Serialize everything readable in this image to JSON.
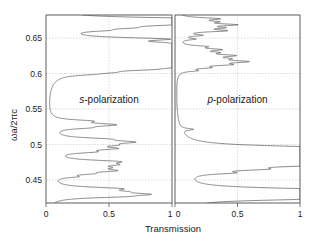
{
  "figure": {
    "title": "",
    "yaxis_label": "ωa/2πc",
    "xaxis_label": "Transmission"
  },
  "panels": [
    {
      "id": "s",
      "label_italic": "s",
      "label_rest": "-polarization",
      "label_full": "s-polarization"
    },
    {
      "id": "p",
      "label_italic": "p",
      "label_rest": "-polarization",
      "label_full": "p-polarization"
    }
  ],
  "axes": {
    "y_ticks": [
      "0.45",
      "0.5",
      "0.55",
      "0.6",
      "0.65"
    ],
    "y_tick_values": [
      0.45,
      0.5,
      0.55,
      0.6,
      0.65
    ],
    "ylim": [
      0.425,
      0.675
    ],
    "x_ticks_left": [
      "0",
      "0.5",
      "1"
    ],
    "x_ticks_right": [
      "0",
      "0.5",
      "1"
    ],
    "x_tick_values": [
      0,
      0.5,
      1
    ],
    "xlim": [
      0,
      1
    ],
    "grid": "dotted-light"
  },
  "chart_data": {
    "type": "line",
    "title": "",
    "xlabel": "Transmission",
    "ylabel": "ωa/2πc",
    "xlim": [
      0,
      1
    ],
    "ylim": [
      0.425,
      0.675
    ],
    "legend": "none",
    "grid": true,
    "orientation": "transmission-on-x, frequency-on-y",
    "series": [
      {
        "name": "s-polarization",
        "panel": "s",
        "x": "transmission",
        "y": "ωa/2πc",
        "description": "Transmission spectrum for s-polarized light; broad high-transmission resonance peaks clustered in two bands (0.80-0.67 upper band, 0.435-0.53 lower band) separated by a wide gap of near-zero transmission between ~0.53 and ~0.665.",
        "peaks": [
          {
            "center": 0.67,
            "height": 0.94,
            "halfwidth": 0.0022
          },
          {
            "center": 0.666,
            "height": 0.8,
            "halfwidth": 0.003
          },
          {
            "center": 0.662,
            "height": 0.52,
            "halfwidth": 0.0026
          },
          {
            "center": 0.658,
            "height": 0.33,
            "halfwidth": 0.0022
          },
          {
            "center": 0.6545,
            "height": 0.2,
            "halfwidth": 0.0018
          },
          {
            "center": 0.643,
            "height": 0.7,
            "halfwidth": 0.0024
          },
          {
            "center": 0.638,
            "height": 0.4,
            "halfwidth": 0.0026
          },
          {
            "center": 0.634,
            "height": 0.6,
            "halfwidth": 0.003
          },
          {
            "center": 0.6295,
            "height": 0.86,
            "halfwidth": 0.0032
          },
          {
            "center": 0.625,
            "height": 0.72,
            "halfwidth": 0.0028
          },
          {
            "center": 0.6205,
            "height": 0.55,
            "halfwidth": 0.0026
          },
          {
            "center": 0.616,
            "height": 0.97,
            "halfwidth": 0.0034
          },
          {
            "center": 0.6115,
            "height": 0.62,
            "halfwidth": 0.0028
          },
          {
            "center": 0.607,
            "height": 0.88,
            "halfwidth": 0.003
          },
          {
            "center": 0.6025,
            "height": 0.38,
            "halfwidth": 0.0024
          },
          {
            "center": 0.5985,
            "height": 0.22,
            "halfwidth": 0.002
          },
          {
            "center": 0.596,
            "height": 0.12,
            "halfwidth": 0.0016
          },
          {
            "center": 0.534,
            "height": 0.25,
            "halfwidth": 0.002
          },
          {
            "center": 0.529,
            "height": 0.47,
            "halfwidth": 0.0026
          },
          {
            "center": 0.525,
            "height": 0.18,
            "halfwidth": 0.0018
          },
          {
            "center": 0.51,
            "height": 0.3,
            "halfwidth": 0.0022
          },
          {
            "center": 0.506,
            "height": 0.52,
            "halfwidth": 0.0026
          },
          {
            "center": 0.502,
            "height": 0.28,
            "halfwidth": 0.0022
          },
          {
            "center": 0.4975,
            "height": 0.4,
            "halfwidth": 0.0024
          },
          {
            "center": 0.493,
            "height": 0.24,
            "halfwidth": 0.002
          },
          {
            "center": 0.48,
            "height": 0.44,
            "halfwidth": 0.0026
          },
          {
            "center": 0.476,
            "height": 0.33,
            "halfwidth": 0.0024
          },
          {
            "center": 0.472,
            "height": 0.26,
            "halfwidth": 0.0022
          },
          {
            "center": 0.468,
            "height": 0.4,
            "halfwidth": 0.0024
          },
          {
            "center": 0.464,
            "height": 0.2,
            "halfwidth": 0.0018
          },
          {
            "center": 0.46,
            "height": 0.14,
            "halfwidth": 0.0016
          },
          {
            "center": 0.444,
            "height": 0.46,
            "halfwidth": 0.0026
          },
          {
            "center": 0.44,
            "height": 0.3,
            "halfwidth": 0.0022
          },
          {
            "center": 0.4365,
            "height": 0.58,
            "halfwidth": 0.0024
          },
          {
            "center": 0.4335,
            "height": 0.36,
            "halfwidth": 0.002
          }
        ]
      },
      {
        "name": "p-polarization",
        "panel": "p",
        "x": "transmission",
        "y": "ωa/2πc",
        "description": "Transmission spectrum for p-polarized light; narrow resonance peaks. Upper band (0.60-0.67) shows low-amplitude spikes; lower band (0.43-0.50) shows stronger, broader peaks reaching near unity transmission.",
        "peaks": [
          {
            "center": 0.67,
            "height": 0.3,
            "halfwidth": 0.0018
          },
          {
            "center": 0.666,
            "height": 0.22,
            "halfwidth": 0.0016
          },
          {
            "center": 0.662,
            "height": 0.4,
            "halfwidth": 0.0018
          },
          {
            "center": 0.658,
            "height": 0.26,
            "halfwidth": 0.0016
          },
          {
            "center": 0.654,
            "height": 0.34,
            "halfwidth": 0.0018
          },
          {
            "center": 0.648,
            "height": 0.16,
            "halfwidth": 0.0014
          },
          {
            "center": 0.643,
            "height": 0.12,
            "halfwidth": 0.0014
          },
          {
            "center": 0.633,
            "height": 0.18,
            "halfwidth": 0.0016
          },
          {
            "center": 0.629,
            "height": 0.28,
            "halfwidth": 0.0018
          },
          {
            "center": 0.625,
            "height": 0.2,
            "halfwidth": 0.0016
          },
          {
            "center": 0.621,
            "height": 0.36,
            "halfwidth": 0.002
          },
          {
            "center": 0.617,
            "height": 0.24,
            "halfwidth": 0.0018
          },
          {
            "center": 0.613,
            "height": 0.46,
            "halfwidth": 0.0022
          },
          {
            "center": 0.609,
            "height": 0.3,
            "halfwidth": 0.0018
          },
          {
            "center": 0.605,
            "height": 0.18,
            "halfwidth": 0.0016
          },
          {
            "center": 0.601,
            "height": 0.12,
            "halfwidth": 0.0014
          },
          {
            "center": 0.523,
            "height": 0.1,
            "halfwidth": 0.0014
          },
          {
            "center": 0.499,
            "height": 0.66,
            "halfwidth": 0.003
          },
          {
            "center": 0.495,
            "height": 0.88,
            "halfwidth": 0.0032
          },
          {
            "center": 0.491,
            "height": 0.74,
            "halfwidth": 0.0028
          },
          {
            "center": 0.487,
            "height": 0.96,
            "halfwidth": 0.0034
          },
          {
            "center": 0.483,
            "height": 0.62,
            "halfwidth": 0.0028
          },
          {
            "center": 0.479,
            "height": 0.8,
            "halfwidth": 0.003
          },
          {
            "center": 0.475,
            "height": 0.58,
            "halfwidth": 0.0026
          },
          {
            "center": 0.47,
            "height": 0.4,
            "halfwidth": 0.0022
          },
          {
            "center": 0.465,
            "height": 0.26,
            "halfwidth": 0.0018
          },
          {
            "center": 0.443,
            "height": 0.7,
            "halfwidth": 0.0028
          },
          {
            "center": 0.4395,
            "height": 0.9,
            "halfwidth": 0.003
          },
          {
            "center": 0.436,
            "height": 0.6,
            "halfwidth": 0.0026
          },
          {
            "center": 0.433,
            "height": 0.78,
            "halfwidth": 0.0028
          },
          {
            "center": 0.43,
            "height": 0.44,
            "halfwidth": 0.0022
          }
        ]
      }
    ]
  }
}
